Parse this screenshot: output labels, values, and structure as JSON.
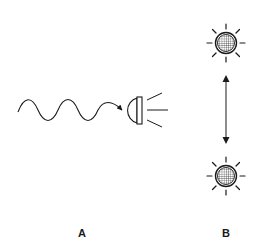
{
  "diagram": {
    "panels": [
      {
        "label": "A",
        "label_pos": {
          "x": 82,
          "y": 227
        },
        "elements": [
          "wavy-arrow",
          "receiver-dome",
          "emitted-rays"
        ],
        "description": "Wave arriving at a hemispherical receiver that emits light rays"
      },
      {
        "label": "B",
        "label_pos": {
          "x": 226,
          "y": 227
        },
        "elements": [
          "sun-top",
          "double-arrow",
          "sun-bottom"
        ],
        "description": "Two radiating spheres connected by a double-headed arrow"
      }
    ],
    "colors": {
      "stroke": "#1a1a1a",
      "background": "#ffffff"
    },
    "geometry": {
      "sun_top": {
        "cx": 226,
        "cy": 43,
        "r": 10
      },
      "sun_bottom": {
        "cx": 226,
        "cy": 176,
        "r": 10
      },
      "double_arrow": {
        "x": 226,
        "y1": 77,
        "y2": 142
      },
      "dome": {
        "x": 137,
        "cy": 110,
        "r": 13
      }
    }
  }
}
